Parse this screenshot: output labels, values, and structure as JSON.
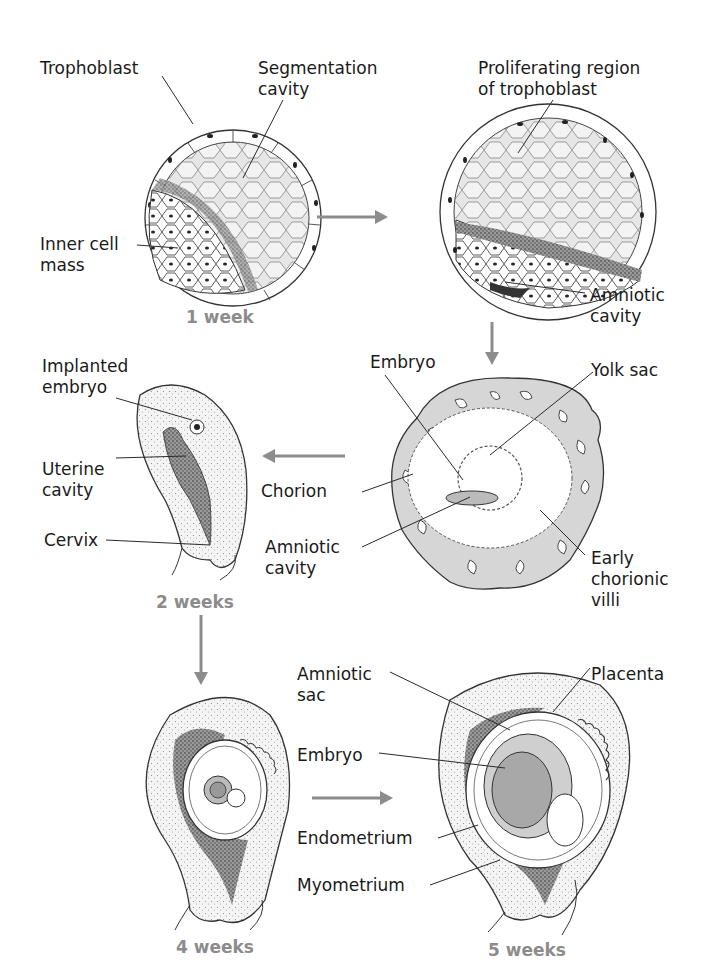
{
  "figure": {
    "colors": {
      "arrow": "#8c8c8c",
      "stage_label": "#8c8c8c",
      "label_text": "#1a1a1a",
      "leader_line": "#2a2a2a",
      "tissue_fill": "#d9d9d9",
      "embryo_fill": "#b8b8b8",
      "dark_tissue": "#3a3a3a"
    }
  },
  "panels": [
    {
      "id": "blastocyst",
      "stage": "1 week",
      "labels": [
        "Trophoblast",
        "Segmentation\ncavity",
        "Inner cell\nmass"
      ]
    },
    {
      "id": "late-blastocyst",
      "stage": "",
      "labels": [
        "Proliferating region\nof trophoblast",
        "Amniotic\ncavity"
      ]
    },
    {
      "id": "chorionic-section",
      "stage": "",
      "labels": [
        "Embryo",
        "Yolk sac",
        "Chorion",
        "Amniotic\ncavity",
        "Early\nchorionic\nvilli"
      ]
    },
    {
      "id": "uterus-2wk",
      "stage": "2 weeks",
      "labels": [
        "Implanted\nembryo",
        "Uterine\ncavity",
        "Cervix"
      ]
    },
    {
      "id": "uterus-4wk",
      "stage": "4 weeks",
      "labels": []
    },
    {
      "id": "uterus-5wk",
      "stage": "5 weeks",
      "labels": [
        "Amniotic\nsac",
        "Placenta",
        "Embryo",
        "Endometrium",
        "Myometrium"
      ]
    }
  ],
  "labels": {
    "trophoblast": "Trophoblast",
    "segmentation_cavity": "Segmentation\ncavity",
    "inner_cell_mass": "Inner cell\nmass",
    "proliferating_region": "Proliferating region\nof trophoblast",
    "amniotic_cavity_1": "Amniotic\ncavity",
    "embryo_1": "Embryo",
    "yolk_sac": "Yolk sac",
    "chorion": "Chorion",
    "amniotic_cavity_2": "Amniotic\ncavity",
    "early_chorionic_villi": "Early\nchorionic\nvilli",
    "implanted_embryo": "Implanted\nembryo",
    "uterine_cavity": "Uterine\ncavity",
    "cervix": "Cervix",
    "amniotic_sac": "Amniotic\nsac",
    "placenta": "Placenta",
    "embryo_2": "Embryo",
    "endometrium": "Endometrium",
    "myometrium": "Myometrium"
  },
  "stages": {
    "week1": "1 week",
    "week2": "2 weeks",
    "week4": "4 weeks",
    "week5": "5 weeks"
  },
  "arrows": [
    {
      "from": "blastocyst",
      "to": "late-blastocyst",
      "direction": "right"
    },
    {
      "from": "late-blastocyst",
      "to": "chorionic-section",
      "direction": "down"
    },
    {
      "from": "chorionic-section",
      "to": "uterus-2wk",
      "direction": "left"
    },
    {
      "from": "uterus-2wk",
      "to": "uterus-4wk",
      "direction": "down"
    },
    {
      "from": "uterus-4wk",
      "to": "uterus-5wk",
      "direction": "right"
    }
  ]
}
